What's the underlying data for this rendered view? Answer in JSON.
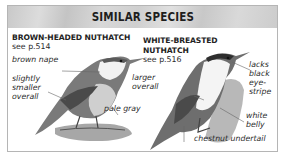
{
  "header": {
    "title": "SIMILAR SPECIES"
  },
  "species": [
    {
      "name": "BROWN-HEADED NUTHATCH",
      "reference": "see p.514",
      "labels": [
        "brown nape",
        "slightly smaller overall",
        "pale gray"
      ]
    },
    {
      "name_line1": "WHITE-BREASTED",
      "name_line2": "NUTHATCH",
      "reference": "see p.516",
      "labels": [
        "larger overall",
        "lacks black eye-stripe",
        "white belly",
        "chestnut undertail"
      ]
    }
  ],
  "label_lines": {
    "slightly": "slightly",
    "smaller": "smaller",
    "overall": "overall",
    "larger": "larger",
    "overall2": "overall",
    "lacks": "lacks",
    "black": "black",
    "eye": "eye-",
    "stripe": "stripe",
    "white": "white",
    "belly": "belly"
  },
  "colors": {
    "header_bg": "#cfcfcf",
    "border": "#b5b5b5",
    "text": "#222222"
  }
}
